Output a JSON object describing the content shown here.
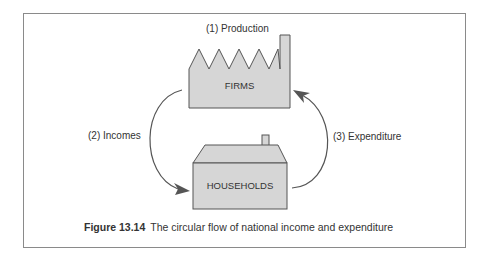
{
  "figure": {
    "caption_label": "Figure 13.14",
    "caption_text": "The circular flow of national income and expenditure"
  },
  "nodes": {
    "firms": {
      "label": "FIRMS",
      "shape": "factory-icon"
    },
    "households": {
      "label": "HOUSEHOLDS",
      "shape": "house-icon"
    }
  },
  "flows": {
    "production": "(1) Production",
    "incomes": "(2) Incomes",
    "expenditure": "(3) Expenditure"
  },
  "colors": {
    "fill": "#d6d6d6",
    "stroke": "#555555",
    "arrow": "#555555",
    "border": "#8a8a8a"
  }
}
